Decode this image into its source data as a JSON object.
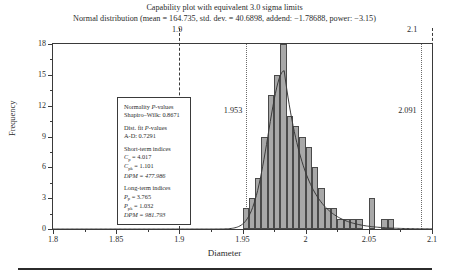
{
  "title": {
    "line1": "Capability plot with equivalent 3.0 sigma limits",
    "line2": "Normal distribution (mean = 164.735, std. dev. = 40.6898, addend: −1.78688, power: −3.15)"
  },
  "spec_limits": {
    "lower_label": "1.9",
    "upper_label": "2.1",
    "lower_value": 1.9,
    "upper_value": 2.1
  },
  "process_limits": {
    "lower_label": "1.953",
    "upper_label": "2.091",
    "lower_value": 1.953,
    "upper_value": 2.091
  },
  "legend": {
    "normality_head": "Normality P-values",
    "normality_item": "Shapiro–Wilk: 0.8671",
    "distfit_head": "Dist. fit P-values",
    "distfit_item": "A-D: 0.7291",
    "short_head": "Short-term indices",
    "short_cp_label": "C",
    "short_cp_sub": "p",
    "short_cp_value": " = 4.017",
    "short_cpk_label": "C",
    "short_cpk_sub": "pk",
    "short_cpk_value": " = 1.101",
    "short_dpm": "DPM = 477.986",
    "long_head": "Long-term indices",
    "long_pp_label": "P",
    "long_pp_sub": "p",
    "long_pp_value": " = 3.765",
    "long_ppk_label": "P",
    "long_ppk_sub": "pk",
    "long_ppk_value": " = 1.032",
    "long_dpm": "DPM = 981.793"
  },
  "chart_data": {
    "type": "bar",
    "title": "Capability plot with equivalent 3.0 sigma limits",
    "subtitle": "Normal distribution (mean = 164.735, std. dev. = 40.6898, addend: −1.78688, power: −3.15)",
    "xlabel": "Diameter",
    "ylabel": "Frequency",
    "xlim": [
      1.8,
      2.1
    ],
    "ylim": [
      0,
      18
    ],
    "xticks": [
      1.8,
      1.85,
      1.9,
      1.95,
      2.0,
      2.05,
      2.1
    ],
    "xticklabels": [
      "1.8",
      "1.85",
      "1.9",
      "1.95",
      "2",
      "2.05",
      "2.1"
    ],
    "yticks": [
      0,
      3,
      6,
      9,
      12,
      15,
      18
    ],
    "yticklabels": [
      "0",
      "3",
      "6",
      "9",
      "12",
      "15",
      "18"
    ],
    "grid": false,
    "legend_position": "upper-left",
    "bin_width": 0.005,
    "bin_starts": [
      1.95,
      1.955,
      1.96,
      1.965,
      1.97,
      1.975,
      1.98,
      1.985,
      1.99,
      1.995,
      2.0,
      2.005,
      2.01,
      2.015,
      2.02,
      2.025,
      2.03,
      2.035,
      2.04,
      2.05,
      2.055,
      2.06,
      2.065
    ],
    "values": [
      2,
      3,
      5,
      9,
      13,
      15,
      18,
      11,
      10,
      9,
      8,
      6,
      4,
      2,
      2,
      1,
      1,
      1,
      1,
      3,
      0,
      1,
      1
    ],
    "annotations": [
      {
        "label": "1.953",
        "x": 1.953,
        "type": "dotted-vertical"
      },
      {
        "label": "2.091",
        "x": 2.091,
        "type": "dotted-vertical"
      },
      {
        "label": "1.9",
        "x": 1.9,
        "type": "dashed-spec-limit"
      },
      {
        "label": "2.1",
        "x": 2.1,
        "type": "dashed-spec-limit"
      }
    ],
    "curve": {
      "name": "fitted normal (transformed) density",
      "peak_x": 1.983,
      "peak_y": 15.4
    }
  }
}
